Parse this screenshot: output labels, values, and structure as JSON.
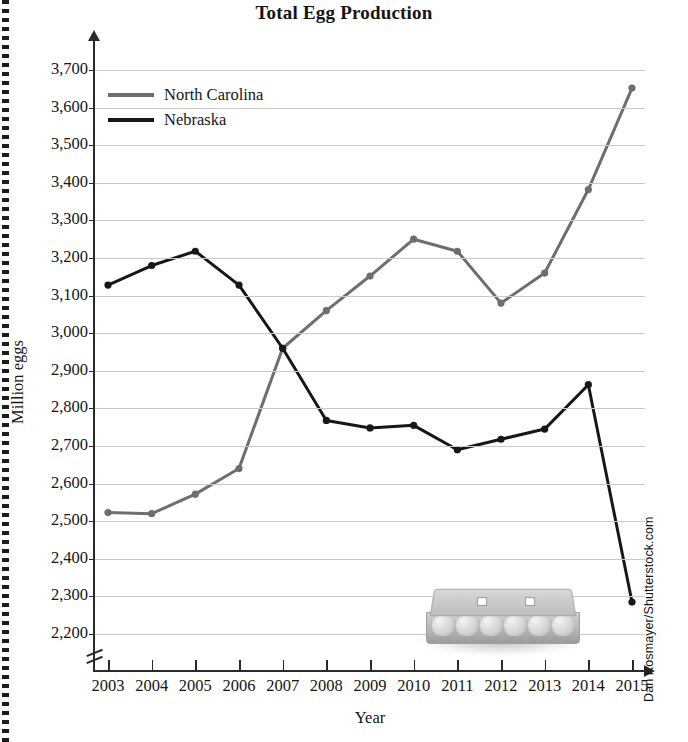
{
  "figure": {
    "title": "Total Egg Production",
    "credit": "Dan Kosmayer/Shutterstock.com",
    "image_caption": "egg-carton-photo"
  },
  "chart_data": {
    "type": "line",
    "title": "Total Egg Production",
    "xlabel": "Year",
    "ylabel": "Million eggs",
    "grid": true,
    "legend_position": "upper-left-inside",
    "axis_broken": true,
    "ylim": [
      2200,
      3700
    ],
    "ytick_step": 100,
    "yticks": [
      3700,
      3600,
      3500,
      3400,
      3300,
      3200,
      3100,
      3000,
      2900,
      2800,
      2700,
      2600,
      2500,
      2400,
      2300,
      2200
    ],
    "ytick_labels": [
      "3,700",
      "3,600",
      "3,500",
      "3,400",
      "3,300",
      "3,200",
      "3,100",
      "3,000",
      "2,900",
      "2,800",
      "2,700",
      "2,600",
      "2,500",
      "2,400",
      "2,300",
      "2,200"
    ],
    "categories": [
      2003,
      2004,
      2005,
      2006,
      2007,
      2008,
      2009,
      2010,
      2011,
      2012,
      2013,
      2014,
      2015
    ],
    "xtick_labels": [
      "2003",
      "2004",
      "2005",
      "2006",
      "2007",
      "2008",
      "2009",
      "2010",
      "2011",
      "2012",
      "2013",
      "2014",
      "2015"
    ],
    "series": [
      {
        "name": "North Carolina",
        "color": "#6e6e6e",
        "values": [
          2523,
          2520,
          2572,
          2640,
          2960,
          3060,
          3152,
          3250,
          3218,
          3080,
          3160,
          3382,
          3652
        ]
      },
      {
        "name": "Nebraska",
        "color": "#171717",
        "values": [
          3128,
          3180,
          3218,
          3128,
          2960,
          2768,
          2748,
          2755,
          2690,
          2718,
          2745,
          2863,
          2285
        ]
      }
    ]
  }
}
